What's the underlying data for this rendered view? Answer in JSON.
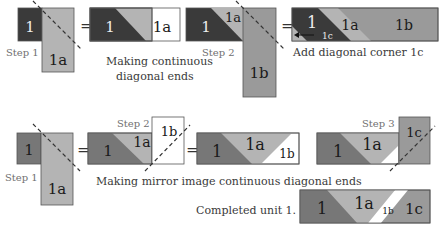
{
  "colors": {
    "dark": "#3a3a3a",
    "medium": "#777777",
    "light": "#b4b4b4",
    "mid_light": "#9a9a9a",
    "white": "#ffffff"
  },
  "top_row": {
    "step1_label": "Step 1",
    "step2_label": "Step 2",
    "piece_1": "1",
    "piece_1a": "1a",
    "piece_1b": "1b",
    "piece_1c": "1c",
    "equals": "=",
    "caption_making": "Making continuous",
    "caption_diagonal": "diagonal ends",
    "caption_add": "Add diagonal corner 1c"
  },
  "bottom_row": {
    "step1_label": "Step 1",
    "step2_label": "Step 2",
    "step3_label": "Step 3",
    "piece_1": "1",
    "piece_1a": "1a",
    "piece_1b": "1b",
    "piece_1c": "1c",
    "equals": "=",
    "caption_mirror": "Making mirror image continuous diagonal ends",
    "caption_completed": "Completed unit 1."
  }
}
